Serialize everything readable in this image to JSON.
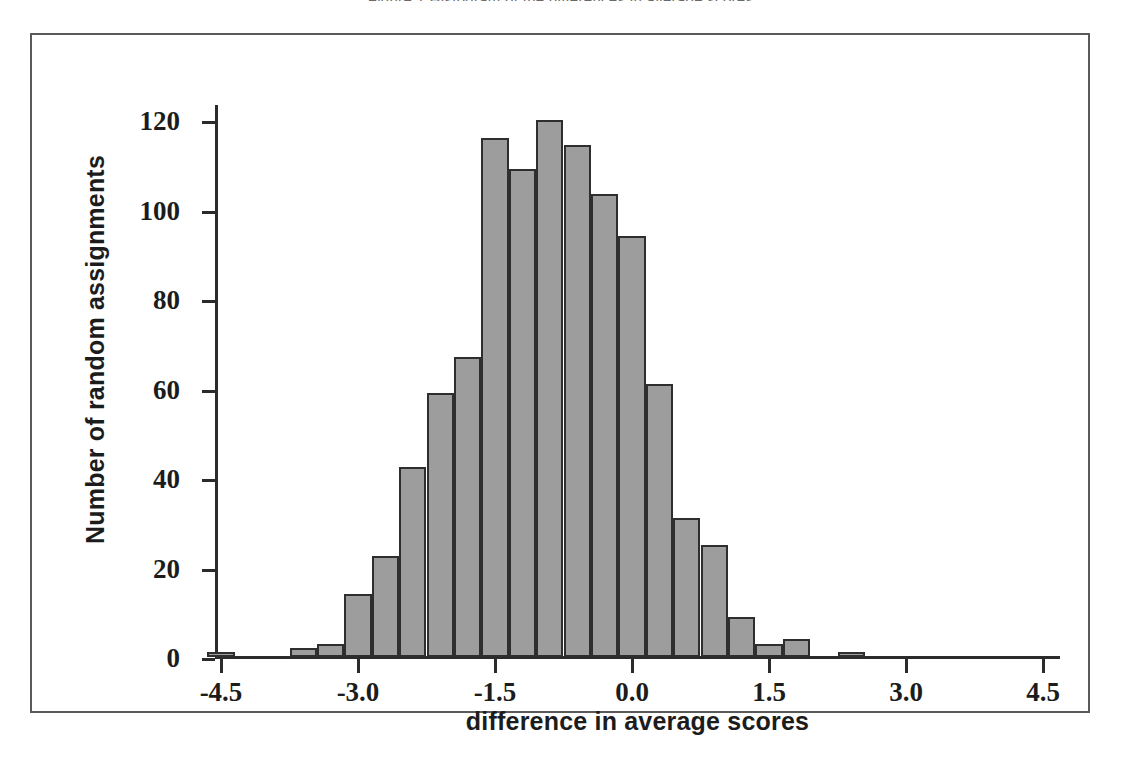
{
  "figure": {
    "top_caption_fragment": "Figure 1 Histogram of the differences in average scores"
  },
  "chart_data": {
    "type": "bar",
    "title": "",
    "subtitle": "",
    "xlabel": "difference in average scores",
    "ylabel": "Number of random assignments",
    "xlim": [
      -4.95,
      4.95
    ],
    "ylim": [
      0,
      125
    ],
    "grid": false,
    "legend": null,
    "bin_width": 0.3,
    "bar_fill_color": "#9d9d9d",
    "bar_edge_color": "#2e2e2e",
    "axis_color": "#2b2b2b",
    "xticks": [
      -4.5,
      -3.0,
      -1.5,
      0.0,
      1.5,
      3.0,
      4.5
    ],
    "xtick_labels": [
      "-4.5",
      "-3.0",
      "-1.5",
      "0.0",
      "1.5",
      "3.0",
      "4.5"
    ],
    "yticks": [
      0,
      20,
      40,
      60,
      80,
      100,
      120
    ],
    "ytick_labels": [
      "0",
      "20",
      "40",
      "60",
      "80",
      "100",
      "120"
    ],
    "bins": [
      {
        "left": -4.65,
        "right": -4.35,
        "center": -4.5,
        "value": 1
      },
      {
        "left": -4.35,
        "right": -4.05,
        "center": -4.2,
        "value": 0
      },
      {
        "left": -4.05,
        "right": -3.75,
        "center": -3.9,
        "value": 0
      },
      {
        "left": -3.75,
        "right": -3.45,
        "center": -3.6,
        "value": 2
      },
      {
        "left": -3.45,
        "right": -3.15,
        "center": -3.3,
        "value": 3
      },
      {
        "left": -3.15,
        "right": -2.85,
        "center": -3.0,
        "value": 14
      },
      {
        "left": -2.85,
        "right": -2.55,
        "center": -2.7,
        "value": 22.5
      },
      {
        "left": -2.55,
        "right": -2.25,
        "center": -2.4,
        "value": 42.5
      },
      {
        "left": -2.25,
        "right": -1.95,
        "center": -2.1,
        "value": 59
      },
      {
        "left": -1.95,
        "right": -1.65,
        "center": -1.8,
        "value": 67
      },
      {
        "left": -1.65,
        "right": -1.35,
        "center": -1.5,
        "value": 116
      },
      {
        "left": -1.35,
        "right": -1.05,
        "center": -1.2,
        "value": 109
      },
      {
        "left": -1.05,
        "right": -0.75,
        "center": -0.9,
        "value": 120
      },
      {
        "left": -0.75,
        "right": -0.45,
        "center": -0.6,
        "value": 114.5
      },
      {
        "left": -0.45,
        "right": -0.15,
        "center": -0.3,
        "value": 103.5
      },
      {
        "left": -0.15,
        "right": 0.15,
        "center": 0.0,
        "value": 94
      },
      {
        "left": 0.15,
        "right": 0.45,
        "center": 0.3,
        "value": 61
      },
      {
        "left": 0.45,
        "right": 0.75,
        "center": 0.6,
        "value": 31
      },
      {
        "left": 0.75,
        "right": 1.05,
        "center": 0.9,
        "value": 25
      },
      {
        "left": 1.05,
        "right": 1.35,
        "center": 1.2,
        "value": 9
      },
      {
        "left": 1.35,
        "right": 1.65,
        "center": 1.5,
        "value": 3
      },
      {
        "left": 1.65,
        "right": 1.95,
        "center": 1.8,
        "value": 4
      },
      {
        "left": 1.95,
        "right": 2.25,
        "center": 2.1,
        "value": 0
      },
      {
        "left": 2.25,
        "right": 2.55,
        "center": 2.4,
        "value": 1
      }
    ],
    "bar_pixel_layout": [
      {
        "x": 7,
        "w": 38,
        "value": 1
      },
      {
        "x": 45,
        "w": 38,
        "value": 0
      },
      {
        "x": 83,
        "w": 38,
        "value": 0
      },
      {
        "x": 121,
        "w": 38,
        "value": 2
      },
      {
        "x": 159,
        "w": 38,
        "value": 3
      },
      {
        "x": 197,
        "w": 38,
        "value": 14
      },
      {
        "x": 235,
        "w": 38,
        "value": 22.5
      },
      {
        "x": 273,
        "w": 38,
        "value": 42.5
      },
      {
        "x": 311,
        "w": 38,
        "value": 59
      },
      {
        "x": 349,
        "w": 38,
        "value": 67
      },
      {
        "x": 387,
        "w": 38,
        "value": 116
      },
      {
        "x": 425,
        "w": 38,
        "value": 109
      },
      {
        "x": 463,
        "w": 38,
        "value": 120
      },
      {
        "x": 501,
        "w": 38,
        "value": 114.5
      },
      {
        "x": 539,
        "w": 38,
        "value": 103.5
      },
      {
        "x": 577,
        "w": 38,
        "value": 94
      },
      {
        "x": 615,
        "w": 38,
        "value": 61
      },
      {
        "x": 653,
        "w": 38,
        "value": 31
      },
      {
        "x": 691,
        "w": 38,
        "value": 25
      },
      {
        "x": 729,
        "w": 38,
        "value": 9
      },
      {
        "x": 767,
        "w": 38,
        "value": 3
      },
      {
        "x": 805,
        "w": 38,
        "value": 4
      },
      {
        "x": 843,
        "w": 38,
        "value": 0
      },
      {
        "x": 881,
        "w": 38,
        "value": 1
      }
    ]
  }
}
